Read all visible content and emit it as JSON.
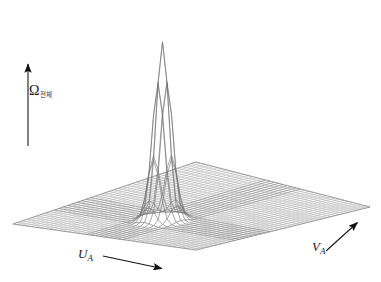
{
  "figure": {
    "title": "",
    "background_color": "#ffffff",
    "line_color": "#808080",
    "text_color": "#1a1a1a"
  },
  "axes": {
    "vertical": {
      "symbol": "Ω",
      "subscript": "전체",
      "arrow": {
        "x1": 28,
        "y1": 146,
        "x2": 28,
        "y2": 62
      }
    },
    "u_axis": {
      "symbol": "U",
      "subscript": "A",
      "arrow": {
        "x1": 103,
        "y1": 256,
        "x2": 164,
        "y2": 269
      }
    },
    "v_axis": {
      "symbol": "V",
      "subscript": "A",
      "arrow": {
        "x1": 326,
        "y1": 251,
        "x2": 359,
        "y2": 221
      }
    }
  },
  "chart_data": {
    "type": "surface",
    "title": "",
    "xlabel": "U_A",
    "ylabel": "V_A",
    "zlabel": "Ω 전체",
    "grid": true,
    "legend": null,
    "projection": {
      "corner_left": [
        13,
        224
      ],
      "corner_bottom": [
        196,
        250
      ],
      "corner_right": [
        370,
        207
      ],
      "corner_top": [
        196,
        162
      ]
    },
    "grid_divisions": {
      "u": 40,
      "v": 40
    },
    "baseline_value": 0,
    "peak": {
      "u_index": 20,
      "v_index": 13,
      "apex_pixel": [
        201,
        10
      ],
      "base_pixel": [
        201,
        188
      ],
      "relative_height": 1.0,
      "half_width_cells": 2
    },
    "z_range": [
      0,
      1
    ]
  }
}
